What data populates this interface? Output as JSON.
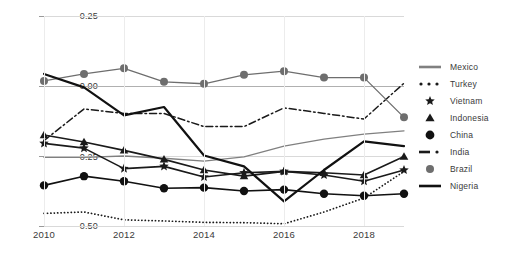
{
  "chart_data": {
    "type": "line",
    "title": "",
    "xlabel": "",
    "ylabel": "",
    "x": [
      2010,
      2011,
      2012,
      2013,
      2014,
      2015,
      2016,
      2017,
      2018,
      2019
    ],
    "xticks": [
      "2010",
      "2012",
      "2014",
      "2016",
      "2018"
    ],
    "xtick_values": [
      2010,
      2012,
      2014,
      2016,
      2018
    ],
    "yticks": [
      "0.25",
      "0.00",
      "-0.25",
      "-0.50"
    ],
    "ytick_values": [
      0.25,
      0.0,
      -0.25,
      -0.5
    ],
    "ylim": [
      -0.5,
      0.25
    ],
    "xlim": [
      2010,
      2019
    ],
    "grid": true,
    "legend_position": "right",
    "series": [
      {
        "name": "Mexico",
        "style": "solid-thin-gray",
        "color": "#808080",
        "marker": "none",
        "values": [
          -0.255,
          -0.255,
          -0.25,
          -0.258,
          -0.268,
          -0.253,
          -0.215,
          -0.19,
          -0.172,
          -0.16
        ]
      },
      {
        "name": "Turkey",
        "style": "dotted",
        "color": "#1a1a1a",
        "marker": "none",
        "values": [
          -0.455,
          -0.45,
          -0.478,
          -0.482,
          -0.487,
          -0.488,
          -0.492,
          -0.45,
          -0.4,
          -0.305
        ]
      },
      {
        "name": "Vietnam",
        "style": "solid-marker",
        "color": "#1a1a1a",
        "marker": "star",
        "values": [
          -0.205,
          -0.222,
          -0.295,
          -0.287,
          -0.325,
          -0.31,
          -0.305,
          -0.318,
          -0.34,
          -0.3
        ]
      },
      {
        "name": "Indonesia",
        "style": "solid-marker",
        "color": "#1a1a1a",
        "marker": "triangle",
        "values": [
          -0.175,
          -0.2,
          -0.23,
          -0.262,
          -0.3,
          -0.322,
          -0.305,
          -0.31,
          -0.318,
          -0.252
        ]
      },
      {
        "name": "China",
        "style": "solid-marker",
        "color": "#111111",
        "marker": "circle",
        "values": [
          -0.355,
          -0.322,
          -0.34,
          -0.365,
          -0.363,
          -0.375,
          -0.37,
          -0.385,
          -0.392,
          -0.385
        ]
      },
      {
        "name": "India",
        "style": "dash-dot",
        "color": "#1a1a1a",
        "marker": "none",
        "values": [
          -0.195,
          -0.082,
          -0.098,
          -0.098,
          -0.145,
          -0.145,
          -0.078,
          -0.098,
          -0.118,
          0.01
        ]
      },
      {
        "name": "Brazil",
        "style": "solid-marker-gray",
        "color": "#6e6e6e",
        "marker": "circle",
        "values": [
          0.018,
          0.043,
          0.063,
          0.015,
          0.008,
          0.04,
          0.053,
          0.03,
          0.03,
          -0.112
        ]
      },
      {
        "name": "Nigeria",
        "style": "solid-thick",
        "color": "#111111",
        "marker": "none",
        "values": [
          0.043,
          -0.005,
          -0.105,
          -0.075,
          -0.248,
          -0.287,
          -0.412,
          -0.3,
          -0.198,
          -0.215
        ]
      }
    ]
  },
  "legend": {
    "entries": [
      {
        "label": "Mexico",
        "key": "line-thick-gray"
      },
      {
        "label": "Turkey",
        "key": "dots"
      },
      {
        "label": "Vietnam",
        "key": "star-marker"
      },
      {
        "label": "Indonesia",
        "key": "triangle-marker"
      },
      {
        "label": "China",
        "key": "circle-marker"
      },
      {
        "label": "India",
        "key": "dash-dot-line"
      },
      {
        "label": "Brazil",
        "key": "gray-circle-marker"
      },
      {
        "label": "Nigeria",
        "key": "line-thick-black"
      }
    ]
  },
  "colors": {
    "gray_series": "#808080",
    "brazil": "#6e6e6e",
    "black_series": "#111111",
    "grid": "#d9d9d9",
    "zero_line": "#b0b0b0",
    "text": "#3a3a3a"
  }
}
